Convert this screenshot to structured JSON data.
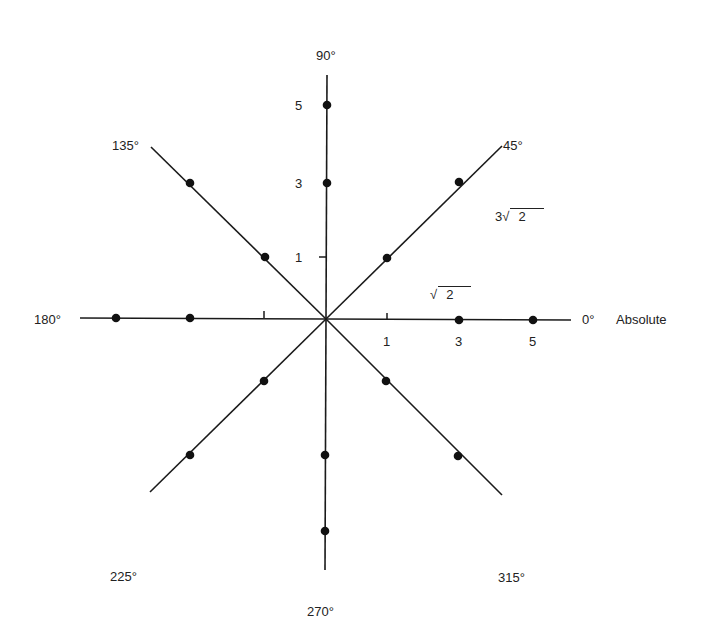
{
  "diagram": {
    "type": "polar-axis-diagram",
    "center": {
      "x": 326,
      "y": 319
    },
    "axis_labels": [
      {
        "id": "a0",
        "text": "0°",
        "x": 582,
        "y": 313
      },
      {
        "id": "a45",
        "text": "45°",
        "x": 503,
        "y": 139
      },
      {
        "id": "a90",
        "text": "90°",
        "x": 316,
        "y": 49
      },
      {
        "id": "a135",
        "text": "135°",
        "x": 112,
        "y": 139
      },
      {
        "id": "a180",
        "text": "180°",
        "x": 34,
        "y": 313
      },
      {
        "id": "a225",
        "text": "225°",
        "x": 110,
        "y": 570
      },
      {
        "id": "a270",
        "text": "270°",
        "x": 307,
        "y": 605
      },
      {
        "id": "a315",
        "text": "315°",
        "x": 498,
        "y": 571
      }
    ],
    "extra_label": {
      "text": "Absolute",
      "x": 616,
      "y": 313
    },
    "tick_labels": [
      {
        "text": "1",
        "x": 383,
        "y": 335
      },
      {
        "text": "3",
        "x": 455,
        "y": 335
      },
      {
        "text": "5",
        "x": 529,
        "y": 335
      },
      {
        "text": "1",
        "x": 295,
        "y": 251
      },
      {
        "text": "3",
        "x": 295,
        "y": 177
      },
      {
        "text": "5",
        "x": 295,
        "y": 99
      }
    ],
    "radical_labels": [
      {
        "coef": "3",
        "radicand": "2",
        "x": 495,
        "y": 208
      },
      {
        "coef": "",
        "radicand": "2",
        "x": 430,
        "y": 286
      }
    ],
    "axes": [
      {
        "angle": 0,
        "end": {
          "x": 571,
          "y": 320
        }
      },
      {
        "angle": 45,
        "end": {
          "x": 502,
          "y": 146
        }
      },
      {
        "angle": 90,
        "end": {
          "x": 327,
          "y": 75
        }
      },
      {
        "angle": 135,
        "end": {
          "x": 151,
          "y": 147
        }
      },
      {
        "angle": 180,
        "end": {
          "x": 80,
          "y": 318
        }
      },
      {
        "angle": 225,
        "end": {
          "x": 150,
          "y": 492
        }
      },
      {
        "angle": 270,
        "end": {
          "x": 325,
          "y": 570
        }
      },
      {
        "angle": 315,
        "end": {
          "x": 502,
          "y": 495
        }
      }
    ],
    "ticks": [
      {
        "x1": 387,
        "y1": 313,
        "x2": 387,
        "y2": 320
      },
      {
        "x1": 264,
        "y1": 311,
        "x2": 264,
        "y2": 318
      },
      {
        "x1": 319,
        "y1": 257,
        "x2": 326,
        "y2": 257
      }
    ],
    "points": [
      {
        "axis": 0,
        "x": 459,
        "y": 320
      },
      {
        "axis": 0,
        "x": 533,
        "y": 320
      },
      {
        "axis": 45,
        "x": 387,
        "y": 258
      },
      {
        "axis": 45,
        "x": 459,
        "y": 182
      },
      {
        "axis": 90,
        "x": 327,
        "y": 183
      },
      {
        "axis": 90,
        "x": 327,
        "y": 105
      },
      {
        "axis": 135,
        "x": 265,
        "y": 257
      },
      {
        "axis": 135,
        "x": 190,
        "y": 183
      },
      {
        "axis": 180,
        "x": 190,
        "y": 318
      },
      {
        "axis": 180,
        "x": 116,
        "y": 318
      },
      {
        "axis": 225,
        "x": 264,
        "y": 381
      },
      {
        "axis": 225,
        "x": 190,
        "y": 455
      },
      {
        "axis": 270,
        "x": 325,
        "y": 455
      },
      {
        "axis": 270,
        "x": 325,
        "y": 531
      },
      {
        "axis": 315,
        "x": 386,
        "y": 381
      },
      {
        "axis": 315,
        "x": 458,
        "y": 456
      }
    ],
    "line_color": "#1a1a1a",
    "point_color": "#111111"
  }
}
